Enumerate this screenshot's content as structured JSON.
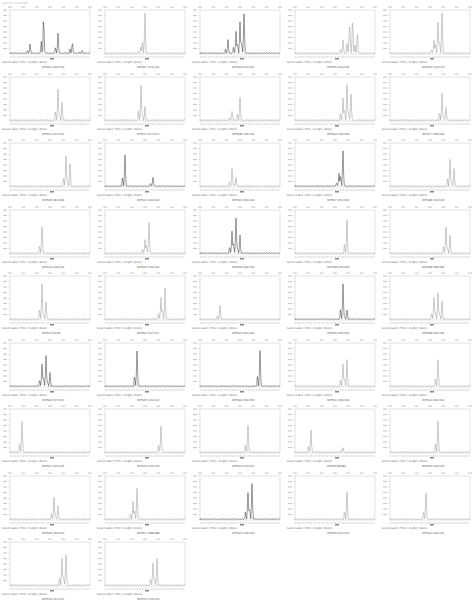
{
  "header": "spectra overview",
  "controls": "Select Label | Trim | Height | Zoom",
  "chart_data": {
    "type": "line",
    "layout": {
      "columns": 5,
      "rows": 9,
      "grid": false
    },
    "panels": [
      {
        "label": "WPS01:123/123",
        "peaks": [
          [
            0.25,
            0.2
          ],
          [
            0.42,
            0.85
          ],
          [
            0.6,
            0.45
          ],
          [
            0.78,
            0.25
          ],
          [
            0.9,
            0.05
          ]
        ],
        "dark": true
      },
      {
        "label": "WPS07:141/141",
        "peaks": [
          [
            0.5,
            0.9
          ],
          [
            0.45,
            0.15
          ]
        ],
        "dark": false
      },
      {
        "label": "WPS03:101/101",
        "peaks": [
          [
            0.35,
            0.3
          ],
          [
            0.45,
            0.5
          ],
          [
            0.5,
            0.7
          ],
          [
            0.55,
            0.9
          ]
        ],
        "dark": true
      },
      {
        "label": "WPS05:102/102",
        "peaks": [
          [
            0.6,
            0.3
          ],
          [
            0.68,
            0.6
          ],
          [
            0.72,
            0.8
          ],
          [
            0.78,
            0.5
          ]
        ],
        "dark": false
      },
      {
        "label": "WPS05:113/113",
        "peaks": [
          [
            0.55,
            0.3
          ],
          [
            0.6,
            0.7
          ],
          [
            0.65,
            0.9
          ]
        ],
        "dark": false
      },
      {
        "label": "WPS11:141/141",
        "peaks": [
          [
            0.6,
            0.7
          ],
          [
            0.65,
            0.4
          ]
        ],
        "dark": false
      },
      {
        "label": "WPS17:117/117",
        "peaks": [
          [
            0.45,
            0.8
          ],
          [
            0.5,
            0.3
          ]
        ],
        "dark": false
      },
      {
        "label": "WPS08:119/119",
        "peaks": [
          [
            0.4,
            0.2
          ],
          [
            0.5,
            0.5
          ]
        ],
        "dark": false
      },
      {
        "label": "WPS04:156/156",
        "peaks": [
          [
            0.6,
            0.5
          ],
          [
            0.65,
            0.8
          ],
          [
            0.7,
            0.6
          ]
        ],
        "dark": false
      },
      {
        "label": "WPS17:166/166",
        "peaks": [
          [
            0.65,
            0.6
          ],
          [
            0.7,
            0.3
          ]
        ],
        "dark": false
      },
      {
        "label": "WPS09:181/181",
        "peaks": [
          [
            0.7,
            0.7
          ],
          [
            0.75,
            0.5
          ]
        ],
        "dark": false
      },
      {
        "label": "WPS11:120/120",
        "peaks": [
          [
            0.25,
            0.7
          ],
          [
            0.6,
            0.2
          ]
        ],
        "dark": true
      },
      {
        "label": "WPS10:103/103",
        "peaks": [
          [
            0.4,
            0.4
          ],
          [
            0.45,
            0.2
          ]
        ],
        "dark": false
      },
      {
        "label": "WPS07:161/161",
        "peaks": [
          [
            0.55,
            0.3
          ],
          [
            0.6,
            0.8
          ]
        ],
        "dark": true
      },
      {
        "label": "WPS08:116/116",
        "peaks": [
          [
            0.75,
            0.6
          ],
          [
            0.8,
            0.4
          ]
        ],
        "dark": false
      },
      {
        "label": "WPS16:119/119",
        "peaks": [
          [
            0.4,
            0.6
          ]
        ],
        "dark": false
      },
      {
        "label": "WPS15:140/140",
        "peaks": [
          [
            0.55,
            0.7
          ],
          [
            0.5,
            0.3
          ]
        ],
        "dark": false
      },
      {
        "label": "WPS09:106/106",
        "peaks": [
          [
            0.4,
            0.5
          ],
          [
            0.45,
            0.8
          ],
          [
            0.5,
            0.4
          ]
        ],
        "dark": true
      },
      {
        "label": "WPS18:156/156",
        "peaks": [
          [
            0.65,
            0.75
          ]
        ],
        "dark": false
      },
      {
        "label": "WPS08:183/183",
        "peaks": [
          [
            0.7,
            0.6
          ],
          [
            0.75,
            0.4
          ]
        ],
        "dark": false
      },
      {
        "label": "WPS11:61/61",
        "peaks": [
          [
            0.4,
            0.8
          ],
          [
            0.45,
            0.4
          ]
        ],
        "dark": false
      },
      {
        "label": "WPS02:147/147",
        "peaks": [
          [
            0.7,
            0.5
          ],
          [
            0.75,
            0.7
          ]
        ],
        "dark": false
      },
      {
        "label": "WPS03:160/160",
        "peaks": [
          [
            0.25,
            0.3
          ]
        ],
        "dark": false
      },
      {
        "label": "WPS06:195/195",
        "peaks": [
          [
            0.6,
            0.8
          ],
          [
            0.65,
            0.2
          ]
        ],
        "dark": true
      },
      {
        "label": "WPS08:190/190",
        "peaks": [
          [
            0.55,
            0.5
          ],
          [
            0.6,
            0.6
          ],
          [
            0.65,
            0.4
          ]
        ],
        "dark": false
      },
      {
        "label": "WPS09:107/107",
        "peaks": [
          [
            0.4,
            0.5
          ],
          [
            0.45,
            0.7
          ],
          [
            0.5,
            0.3
          ]
        ],
        "dark": true
      },
      {
        "label": "WPS15:121/121",
        "peaks": [
          [
            0.4,
            0.8
          ]
        ],
        "dark": true
      },
      {
        "label": "WPS04:136/136",
        "peaks": [
          [
            0.75,
            0.8
          ]
        ],
        "dark": true
      },
      {
        "label": "WPS01:149/149",
        "peaks": [
          [
            0.6,
            0.5
          ],
          [
            0.65,
            0.6
          ]
        ],
        "dark": false
      },
      {
        "label": "WPS10:162/162",
        "peaks": [
          [
            0.6,
            0.6
          ]
        ],
        "dark": false
      },
      {
        "label": "WPS01:145/145",
        "peaks": [
          [
            0.15,
            0.7
          ]
        ],
        "dark": false
      },
      {
        "label": "WPS10:176/176",
        "peaks": [
          [
            0.7,
            0.6
          ]
        ],
        "dark": false
      },
      {
        "label": "WPS10:110/110",
        "peaks": [
          [
            0.6,
            0.6
          ]
        ],
        "dark": false
      },
      {
        "label": "WPS06:84/84",
        "peaks": [
          [
            0.2,
            0.5
          ],
          [
            0.6,
            0.1
          ]
        ],
        "dark": false
      },
      {
        "label": "WPS13:116/116",
        "peaks": [
          [
            0.6,
            0.7
          ]
        ],
        "dark": false
      },
      {
        "label": "WPS06:130/130",
        "peaks": [
          [
            0.55,
            0.5
          ],
          [
            0.6,
            0.3
          ]
        ],
        "dark": false
      },
      {
        "label": "WPS07:188/188",
        "peaks": [
          [
            0.35,
            0.4
          ],
          [
            0.4,
            0.7
          ]
        ],
        "dark": false
      },
      {
        "label": "WPS10:144/144",
        "peaks": [
          [
            0.6,
            0.6
          ],
          [
            0.65,
            0.8
          ]
        ],
        "dark": true
      },
      {
        "label": "WPS06:121/121",
        "peaks": [
          [
            0.65,
            0.6
          ]
        ],
        "dark": false
      },
      {
        "label": "WPS14:141/141",
        "peaks": [
          [
            0.45,
            0.6
          ]
        ],
        "dark": false
      },
      {
        "label": "WPS14:111/111",
        "peaks": [
          [
            0.65,
            0.6
          ],
          [
            0.7,
            0.7
          ]
        ],
        "dark": false
      },
      {
        "label": "WPS14:176/176",
        "peaks": [
          [
            0.6,
            0.5
          ],
          [
            0.65,
            0.6
          ]
        ],
        "dark": false
      }
    ]
  }
}
